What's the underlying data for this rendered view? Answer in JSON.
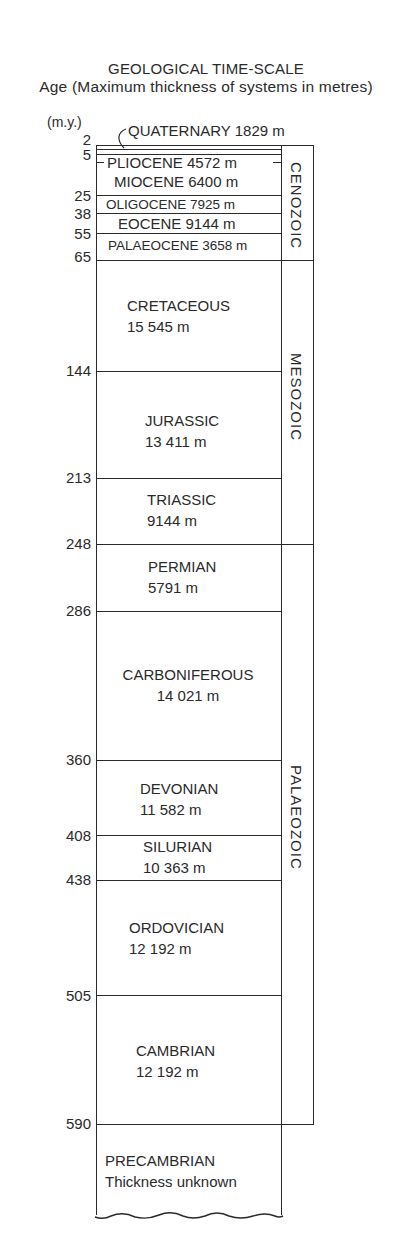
{
  "header": {
    "title": "GEOLOGICAL TIME-SCALE",
    "subtitle": "Age (Maximum thickness of systems in metres)",
    "age_unit": "(m.y.)"
  },
  "colors": {
    "ink": "#2a2a2a",
    "background": "#ffffff"
  },
  "ages": [
    "2",
    "5",
    "25",
    "38",
    "55",
    "65",
    "144",
    "213",
    "248",
    "286",
    "360",
    "408",
    "438",
    "505",
    "590"
  ],
  "periods": [
    {
      "name": "QUATERNARY",
      "thickness": "1829 m",
      "label": "QUATERNARY 1829 m"
    },
    {
      "name": "PLIOCENE",
      "thickness": "4572 m",
      "label": "PLIOCENE 4572 m"
    },
    {
      "name": "MIOCENE",
      "thickness": "6400 m",
      "label": "MIOCENE 6400 m"
    },
    {
      "name": "OLIGOCENE",
      "thickness": "7925 m",
      "label": "OLIGOCENE 7925 m"
    },
    {
      "name": "EOCENE",
      "thickness": "9144 m",
      "label": "EOCENE 9144 m"
    },
    {
      "name": "PALAEOCENE",
      "thickness": "3658 m",
      "label": "PALAEOCENE 3658 m"
    },
    {
      "name": "CRETACEOUS",
      "thickness": "15 545 m"
    },
    {
      "name": "JURASSIC",
      "thickness": "13 411 m"
    },
    {
      "name": "TRIASSIC",
      "thickness": "9144 m"
    },
    {
      "name": "PERMIAN",
      "thickness": "5791 m"
    },
    {
      "name": "CARBONIFEROUS",
      "thickness": "14 021 m"
    },
    {
      "name": "DEVONIAN",
      "thickness": "11 582 m"
    },
    {
      "name": "SILURIAN",
      "thickness": "10 363 m"
    },
    {
      "name": "ORDOVICIAN",
      "thickness": "12 192 m"
    },
    {
      "name": "CAMBRIAN",
      "thickness": "12 192 m"
    },
    {
      "name": "PRECAMBRIAN",
      "thickness": "Thickness unknown"
    }
  ],
  "eras": [
    "CENOZOIC",
    "MESOZOIC",
    "PALAEOZOIC"
  ]
}
